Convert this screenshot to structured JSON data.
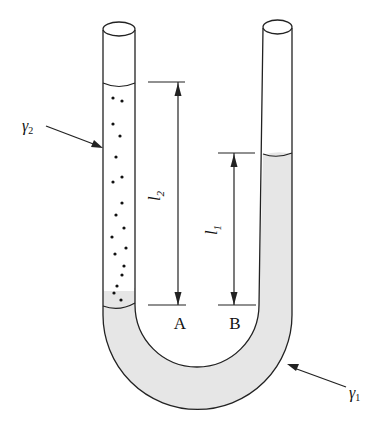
{
  "diagram": {
    "type": "u-tube-manometer",
    "colors": {
      "stroke": "#222222",
      "liquid_gamma1": "#e6e6e6",
      "liquid_gamma2": "#ffffff",
      "background": "#ffffff"
    },
    "labels": {
      "gamma2": {
        "symbol": "γ",
        "subscript": "2"
      },
      "gamma1": {
        "symbol": "γ",
        "subscript": "1"
      },
      "l2": {
        "symbol": "l",
        "subscript": "2"
      },
      "l1": {
        "symbol": "l",
        "subscript": "1"
      },
      "point_a": "A",
      "point_b": "B"
    },
    "left_leg_fluid": "γ2 (dotted, lighter liquid)",
    "bottom_fluid": "γ1 (shaded, heavier liquid)"
  }
}
